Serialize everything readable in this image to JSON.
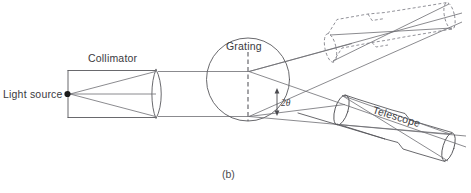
{
  "figure": {
    "caption": "(b)",
    "labels": {
      "light_source": "Light source",
      "collimator": "Collimator",
      "grating": "Grating",
      "telescope": "Telescope",
      "angle": "2θ"
    },
    "colors": {
      "background": "#ffffff",
      "line": "#58585c",
      "ray": "#6d6d72",
      "dashed": "#7e7e86",
      "text": "#3a3a3e",
      "source_dot": "#1b1b1b"
    },
    "elements": {
      "light_source_dot": "filled-circle-marker",
      "collimator_tube": "rectangular-tube-with-lens",
      "collimator_lens": "biconvex-lens",
      "grating_line": "dashed-vertical-line",
      "grating_circle": "circular-table-outline",
      "telescope_tube": "tilted-tube-with-objective-lens-and-eyepiece",
      "telescope_alternate": "dashed-outline-alternate-position",
      "angle_marker": "double-headed-arrow"
    }
  }
}
